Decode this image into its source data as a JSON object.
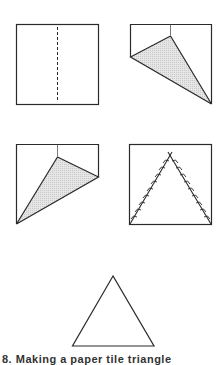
{
  "figure": {
    "caption": "8.  Making a paper tile triangle",
    "colors": {
      "stroke": "#2a2a2a",
      "fill_shaded": "#d9d9d9",
      "background": "#ffffff"
    },
    "steps": [
      {
        "id": 1,
        "description": "square with dashed vertical center fold line"
      },
      {
        "id": 2,
        "description": "top-left corner folded to center line, shaded flap"
      },
      {
        "id": 3,
        "description": "top-right corner folded to center line, shaded flap"
      },
      {
        "id": 4,
        "description": "square with two stitched diagonal lines forming an inverted V"
      },
      {
        "id": 5,
        "description": "finished equilateral triangle"
      }
    ]
  }
}
